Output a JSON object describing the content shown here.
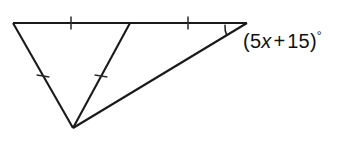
{
  "figure": {
    "kind": "geometry-diagram",
    "background_color": "#ffffff",
    "stroke_color": "#1a1a1a",
    "tick_color": "#2a2a2a",
    "canvas": {
      "width": 345,
      "height": 143
    },
    "points": {
      "top_left": {
        "x": 13,
        "y": 23
      },
      "top_middle": {
        "x": 130,
        "y": 23
      },
      "top_right": {
        "x": 247,
        "y": 23
      },
      "bottom_apex": {
        "x": 73,
        "y": 128
      }
    },
    "segments": [
      {
        "name": "top-left-segment",
        "from": "top_left",
        "to": "top_middle",
        "ticks": 1
      },
      {
        "name": "top-right-segment",
        "from": "top_middle",
        "to": "top_right",
        "ticks": 1
      },
      {
        "name": "left-leg-segment",
        "from": "top_left",
        "to": "bottom_apex",
        "ticks": 1
      },
      {
        "name": "cevian-segment",
        "from": "top_middle",
        "to": "bottom_apex",
        "ticks": 1
      },
      {
        "name": "long-base-segment",
        "from": "top_right",
        "to": "bottom_apex",
        "ticks": 0
      }
    ],
    "tick_marks": [
      {
        "name": "tick-top-left",
        "x": 71,
        "y": 23,
        "angle_deg": 90,
        "length": 13
      },
      {
        "name": "tick-top-right",
        "x": 188,
        "y": 23,
        "angle_deg": 90,
        "length": 13
      },
      {
        "name": "tick-left-leg",
        "x": 43,
        "y": 76,
        "angle_deg": 8,
        "length": 13
      },
      {
        "name": "tick-cevian",
        "x": 101,
        "y": 76,
        "angle_deg": 8,
        "length": 13
      }
    ],
    "angle_arc": {
      "name": "angle-arc-right-vertex",
      "vertex": "top_right",
      "radius": 22,
      "start_deg": 180,
      "end_deg": 204
    }
  },
  "labels": {
    "angle_expression": {
      "name": "angle-label",
      "full_text": "(5x + 15)°",
      "open_paren": "(",
      "coefficient": "5",
      "variable": "x",
      "operator": "+",
      "constant": "15",
      "close_paren": ")",
      "degree_symbol": "°",
      "color": "#111111",
      "x": 243,
      "y": 29
    }
  }
}
